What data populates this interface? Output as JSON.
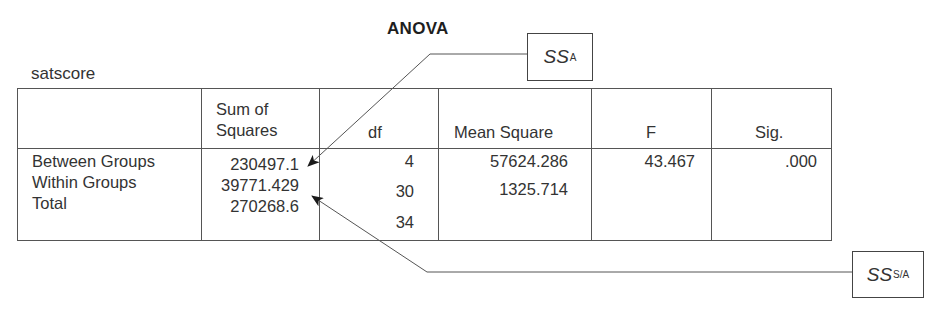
{
  "title": "ANOVA",
  "variable": "satscore",
  "table": {
    "headers": {
      "source": "",
      "sum_of_squares_line1": "Sum of",
      "sum_of_squares_line2": "Squares",
      "df": "df",
      "mean_square": "Mean Square",
      "f": "F",
      "sig": "Sig."
    },
    "rows": [
      {
        "source": "Between Groups",
        "sum_of_squares": "230497.1",
        "df": "4",
        "mean_square": "57624.286",
        "f": "43.467",
        "sig": ".000"
      },
      {
        "source": "Within Groups",
        "sum_of_squares": "39771.429",
        "df": "30",
        "mean_square": "1325.714",
        "f": "",
        "sig": ""
      },
      {
        "source": "Total",
        "sum_of_squares": "270268.6",
        "df": "34",
        "mean_square": "",
        "f": "",
        "sig": ""
      }
    ]
  },
  "callouts": {
    "ss_a": {
      "main": "SS",
      "sub": "A",
      "points_to": "Between Groups Sum of Squares"
    },
    "ss_sa": {
      "main": "SS",
      "sub": "S/A",
      "points_to": "Within Groups Sum of Squares"
    }
  },
  "colors": {
    "text": "#333333",
    "border": "#555555",
    "background": "#ffffff"
  }
}
